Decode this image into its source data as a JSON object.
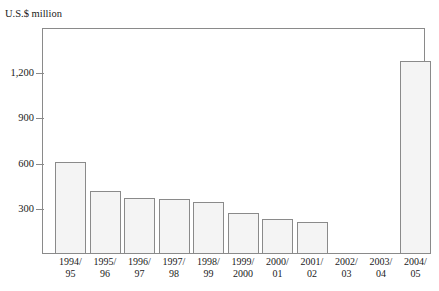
{
  "chart_data": {
    "type": "bar",
    "title": "",
    "subtitle": "",
    "xlabel": "",
    "ylabel": "U.S.$ million",
    "unit_caption": "U.S.$ million",
    "categories": [
      "1994/95",
      "1995/96",
      "1996/97",
      "1997/98",
      "1998/99",
      "1999/2000",
      "2000/01",
      "2001/02",
      "2002/03",
      "2003/04",
      "2004/05"
    ],
    "category_lines": [
      {
        "line1": "1994/",
        "line2": "95"
      },
      {
        "line1": "1995/",
        "line2": "96"
      },
      {
        "line1": "1996/",
        "line2": "97"
      },
      {
        "line1": "1997/",
        "line2": "98"
      },
      {
        "line1": "1998/",
        "line2": "99"
      },
      {
        "line1": "1999/",
        "line2": "2000"
      },
      {
        "line1": "2000/",
        "line2": "01"
      },
      {
        "line1": "2001/",
        "line2": "02"
      },
      {
        "line1": "2002/",
        "line2": "03"
      },
      {
        "line1": "2003/",
        "line2": "04"
      },
      {
        "line1": "2004/",
        "line2": "05"
      }
    ],
    "values": [
      610,
      420,
      370,
      365,
      345,
      270,
      230,
      210,
      0,
      0,
      1280
    ],
    "ylim": [
      0,
      1500
    ],
    "yticks": [
      300,
      600,
      900,
      1200
    ],
    "ytick_labels": [
      "300",
      "600",
      "900",
      "1,200"
    ],
    "grid": false,
    "legend": null,
    "legend_position": "none",
    "bar_fill_color": "#f4f4f4",
    "bar_border_color": "#8a8a8a",
    "axis_color": "#8a8a8a",
    "text_color": "#1a1a1a",
    "background_color": "#ffffff"
  }
}
